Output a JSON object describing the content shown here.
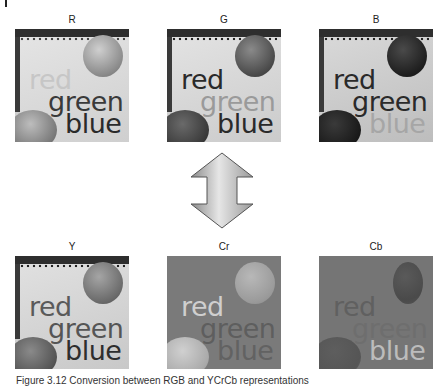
{
  "figure": {
    "top_row": [
      {
        "label": "R",
        "words": [
          "red",
          "green",
          "blue"
        ]
      },
      {
        "label": "G",
        "words": [
          "red",
          "green",
          "blue"
        ]
      },
      {
        "label": "B",
        "words": [
          "red",
          "green",
          "blue"
        ]
      }
    ],
    "bottom_row": [
      {
        "label": "Y",
        "words": [
          "red",
          "green",
          "blue"
        ]
      },
      {
        "label": "Cr",
        "words": [
          "red",
          "green",
          "blue"
        ]
      },
      {
        "label": "Cb",
        "words": [
          "red",
          "green",
          "blue"
        ]
      }
    ],
    "arrow": "double-vertical-arrow",
    "caption": "Figure 3.12  Conversion between RGB and YCrCb representations"
  },
  "colors": {
    "page_background": "#ffffff",
    "arrow_fill_light": "#e6e6e6",
    "arrow_fill_dark": "#8a8a8a",
    "arrow_stroke": "#555555"
  }
}
